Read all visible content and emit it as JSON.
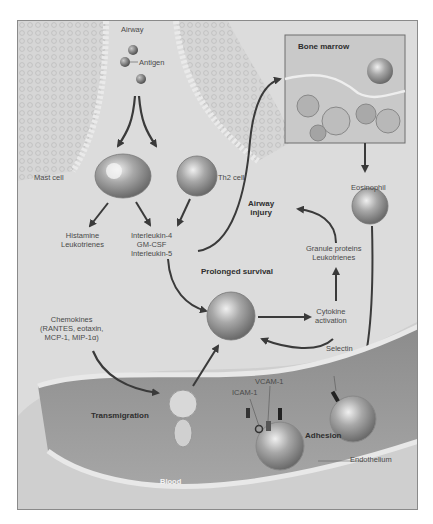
{
  "diagram": {
    "regions": {
      "airway": "Airway",
      "bone_marrow": "Bone marrow",
      "blood": "Blood",
      "endothelium": "Endothelium"
    },
    "nodes": {
      "antigen": "Antigen",
      "mast_cell": "Mast cell",
      "th2_cell": "Th2 cell",
      "mast_products": [
        "Histamine",
        "Leukotrienes"
      ],
      "th2_products": [
        "Interleukin-4",
        "GM-CSF",
        "Interleukin-5"
      ],
      "eosinophil": "Eosinophil",
      "airway_injury": [
        "Airway",
        "injury"
      ],
      "granule_products": [
        "Granule proteins",
        "Leukotrienes"
      ],
      "prolonged_survival": "Prolonged survival",
      "cytokine_activation": [
        "Cytokine",
        "activation"
      ],
      "chemokines": [
        "Chemokines",
        "(RANTES, eotaxin,",
        "MCP-1, MIP-1α)"
      ],
      "transmigration": "Transmigration",
      "adhesion": "Adhesion",
      "selectin": "Selectin",
      "vcam": "VCAM-1",
      "icam": "ICAM-1"
    },
    "edges": [
      {
        "from": "Antigen",
        "to": "Mast cell"
      },
      {
        "from": "Antigen",
        "to": "Th2 cell"
      },
      {
        "from": "Mast cell",
        "to": "Histamine / Leukotrienes"
      },
      {
        "from": "Mast cell",
        "to": "Interleukin-4 / GM-CSF / Interleukin-5"
      },
      {
        "from": "Th2 cell",
        "to": "Interleukin-4 / GM-CSF / Interleukin-5"
      },
      {
        "from": "Interleukin-5",
        "to": "Bone marrow"
      },
      {
        "from": "Bone marrow",
        "to": "Eosinophil"
      },
      {
        "from": "Eosinophil",
        "to": "Adhesion"
      },
      {
        "from": "Interleukin-5",
        "to": "Prolonged survival"
      },
      {
        "from": "Chemokines",
        "to": "Transmigration"
      },
      {
        "from": "Transmigration",
        "to": "Prolonged survival"
      },
      {
        "from": "Prolonged survival",
        "to": "Cytokine activation"
      },
      {
        "from": "Cytokine activation",
        "to": "Prolonged survival"
      },
      {
        "from": "Cytokine activation",
        "to": "Granule proteins / Leukotrienes"
      },
      {
        "from": "Granule proteins / Leukotrienes",
        "to": "Airway injury"
      }
    ]
  }
}
